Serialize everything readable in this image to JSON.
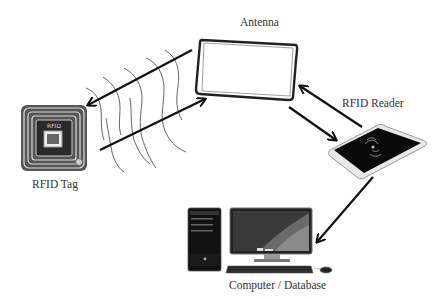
{
  "diagram": {
    "nodes": [
      {
        "id": "tag",
        "label": "RFID Tag",
        "icon": "rfid-tag-icon"
      },
      {
        "id": "antenna",
        "label": "Antenna",
        "icon": "antenna-loop-icon"
      },
      {
        "id": "reader",
        "label": "RFID Reader",
        "icon": "rfid-reader-icon"
      },
      {
        "id": "computer",
        "label": "Computer / Database",
        "icon": "desktop-computer-icon"
      }
    ],
    "edges": [
      {
        "from": "antenna",
        "to": "tag",
        "type": "arrow"
      },
      {
        "from": "tag",
        "to": "antenna",
        "type": "arrow"
      },
      {
        "from": "antenna",
        "to": "reader",
        "type": "arrow"
      },
      {
        "from": "reader",
        "to": "antenna",
        "type": "arrow"
      },
      {
        "from": "reader",
        "to": "computer",
        "type": "arrow"
      }
    ],
    "colors": {
      "stroke": "#111111",
      "label": "#333333",
      "tag_dark": "#2a2a2a",
      "reader_face": "#0a0a0a",
      "reader_edge": "#cfcfcf"
    }
  }
}
